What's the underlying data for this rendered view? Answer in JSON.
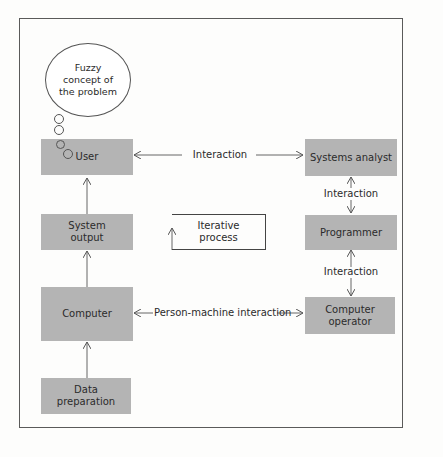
{
  "diagram": {
    "thought_bubble": "Fuzzy concept of the problem",
    "nodes": {
      "user": "User",
      "system_output": "System output",
      "computer": "Computer",
      "data_preparation": "Data preparation",
      "systems_analyst": "Systems analyst",
      "programmer": "Programmer",
      "computer_operator": "Computer operator"
    },
    "edges": {
      "user_analyst": "Interaction",
      "analyst_programmer": "Interaction",
      "programmer_operator": "Interaction",
      "computer_operator": "Person-machine interaction"
    },
    "iterative_process": "Iterative process",
    "colors": {
      "box_fill": "#b4b4b4",
      "line": "#555555"
    }
  }
}
